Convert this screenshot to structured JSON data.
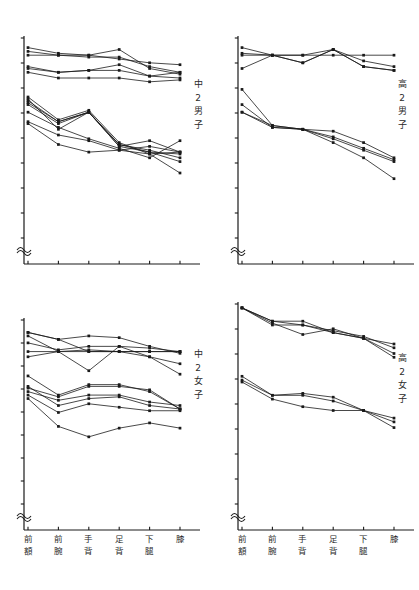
{
  "figure": {
    "title": "",
    "panel_count": 4,
    "x_categories": [
      {
        "id": "forehead",
        "chars": [
          "前",
          "額"
        ]
      },
      {
        "id": "forearm",
        "chars": [
          "前",
          "腕"
        ]
      },
      {
        "id": "hand-dorsum",
        "chars": [
          "手",
          "背"
        ]
      },
      {
        "id": "foot-dorsum",
        "chars": [
          "足",
          "背"
        ]
      },
      {
        "id": "lower-leg",
        "chars": [
          "下",
          "腿"
        ]
      },
      {
        "id": "knee",
        "chars": [
          "膝",
          ""
        ]
      }
    ],
    "axis_break_symbol": "≈",
    "colors": {
      "ink": "#1a1a1a",
      "axis": "#1a1a1a",
      "background": "#ffffff"
    }
  },
  "chart_data": [
    {
      "panel_id": "junior-high-2-boys",
      "type": "line",
      "title": "",
      "group_label_chars": [
        "中",
        "2",
        "男",
        "子"
      ],
      "xlabel": "",
      "ylabel": "",
      "categories": [
        "前額",
        "前腕",
        "手背",
        "足背",
        "下腿",
        "膝"
      ],
      "xlim": [
        0,
        5
      ],
      "ylim": [
        0,
        100
      ],
      "grid": false,
      "legend": "none",
      "y_axis_break": true,
      "y_tick_count": 9,
      "series": [
        {
          "name": "upper-a",
          "cluster": "upper",
          "values": [
            96,
            93,
            92,
            95,
            85,
            82
          ]
        },
        {
          "name": "upper-b",
          "cluster": "upper",
          "values": [
            94,
            92,
            91,
            91,
            86,
            83
          ]
        },
        {
          "name": "upper-c",
          "cluster": "upper",
          "values": [
            92,
            92,
            92,
            90,
            88,
            87
          ]
        },
        {
          "name": "upper-d",
          "cluster": "upper",
          "values": [
            86,
            83,
            84,
            87,
            81,
            80
          ]
        },
        {
          "name": "upper-e",
          "cluster": "upper",
          "values": [
            85,
            83,
            84,
            84,
            81,
            83
          ]
        },
        {
          "name": "upper-f",
          "cluster": "upper",
          "values": [
            83,
            80,
            80,
            80,
            78,
            79
          ]
        },
        {
          "name": "lower-a",
          "cluster": "lower",
          "values": [
            70,
            58,
            63,
            46,
            40,
            30
          ]
        },
        {
          "name": "lower-b",
          "cluster": "lower",
          "values": [
            68,
            57,
            62,
            45,
            41,
            36
          ]
        },
        {
          "name": "lower-c",
          "cluster": "lower",
          "values": [
            67,
            57,
            62,
            45,
            42,
            38
          ]
        },
        {
          "name": "lower-d",
          "cluster": "lower",
          "values": [
            66,
            56,
            62,
            44,
            41,
            40
          ]
        },
        {
          "name": "lower-e",
          "cluster": "lower",
          "values": [
            69,
            53,
            62,
            44,
            47,
            41
          ]
        },
        {
          "name": "lower-f",
          "cluster": "lower",
          "values": [
            57,
            50,
            47,
            42,
            40,
            41
          ]
        },
        {
          "name": "lower-g",
          "cluster": "lower",
          "values": [
            56,
            45,
            41,
            42,
            44,
            41
          ]
        },
        {
          "name": "lower-h",
          "cluster": "lower",
          "values": [
            62,
            54,
            48,
            43,
            38,
            47
          ]
        }
      ]
    },
    {
      "panel_id": "high-school-2-boys",
      "type": "line",
      "title": "",
      "group_label_chars": [
        "高",
        "2",
        "男",
        "子"
      ],
      "xlabel": "",
      "ylabel": "",
      "categories": [
        "前額",
        "前腕",
        "手背",
        "足背",
        "下腿",
        "膝"
      ],
      "xlim": [
        0,
        5
      ],
      "ylim": [
        0,
        100
      ],
      "grid": false,
      "legend": "none",
      "y_axis_break": true,
      "y_tick_count": 9,
      "series": [
        {
          "name": "upper-a",
          "cluster": "upper",
          "values": [
            96,
            92,
            92,
            95,
            89,
            86
          ]
        },
        {
          "name": "upper-b",
          "cluster": "upper",
          "values": [
            92,
            92,
            92,
            92,
            92,
            92
          ]
        },
        {
          "name": "upper-c",
          "cluster": "upper",
          "values": [
            93,
            92,
            88,
            95,
            86,
            84
          ]
        },
        {
          "name": "upper-d",
          "cluster": "upper",
          "values": [
            85,
            92,
            88,
            95,
            86,
            84
          ]
        },
        {
          "name": "lower-a",
          "cluster": "lower",
          "values": [
            74,
            55,
            53,
            46,
            38,
            27
          ]
        },
        {
          "name": "lower-b",
          "cluster": "lower",
          "values": [
            66,
            54,
            53,
            52,
            46,
            38
          ]
        },
        {
          "name": "lower-c",
          "cluster": "lower",
          "values": [
            62,
            54,
            53,
            48,
            42,
            36
          ]
        },
        {
          "name": "lower-d",
          "cluster": "lower",
          "values": [
            62,
            55,
            53,
            49,
            43,
            37
          ]
        }
      ]
    },
    {
      "panel_id": "junior-high-2-girls",
      "type": "line",
      "title": "",
      "group_label_chars": [
        "中",
        "2",
        "女",
        "子"
      ],
      "xlabel": "",
      "ylabel": "",
      "categories": [
        "前額",
        "前腕",
        "手背",
        "足背",
        "下腿",
        "膝"
      ],
      "xlim": [
        0,
        5
      ],
      "ylim": [
        0,
        100
      ],
      "grid": false,
      "legend": "none",
      "y_axis_break": true,
      "y_tick_count": 9,
      "series": [
        {
          "name": "upper-a",
          "cluster": "upper",
          "values": [
            94,
            90,
            92,
            91,
            86,
            82
          ]
        },
        {
          "name": "upper-b",
          "cluster": "upper",
          "values": [
            94,
            90,
            83,
            83,
            83,
            83
          ]
        },
        {
          "name": "upper-c",
          "cluster": "upper",
          "values": [
            88,
            84,
            86,
            86,
            85,
            83
          ]
        },
        {
          "name": "upper-d",
          "cluster": "upper",
          "values": [
            83,
            83,
            83,
            83,
            83,
            83
          ]
        },
        {
          "name": "upper-e",
          "cluster": "upper",
          "values": [
            92,
            83,
            72,
            86,
            80,
            70
          ]
        },
        {
          "name": "upper-f",
          "cluster": "upper",
          "values": [
            80,
            83,
            84,
            83,
            80,
            76
          ]
        },
        {
          "name": "lower-a",
          "cluster": "lower",
          "values": [
            69,
            58,
            64,
            64,
            60,
            50
          ]
        },
        {
          "name": "lower-b",
          "cluster": "lower",
          "values": [
            62,
            57,
            63,
            63,
            61,
            50
          ]
        },
        {
          "name": "lower-c",
          "cluster": "lower",
          "values": [
            60,
            55,
            58,
            58,
            54,
            52
          ]
        },
        {
          "name": "lower-d",
          "cluster": "lower",
          "values": [
            63,
            52,
            56,
            57,
            52,
            50
          ]
        },
        {
          "name": "lower-e",
          "cluster": "lower",
          "values": [
            58,
            48,
            53,
            51,
            49,
            49
          ]
        },
        {
          "name": "lower-f",
          "cluster": "lower",
          "values": [
            56,
            40,
            34,
            39,
            42,
            39
          ]
        }
      ]
    },
    {
      "panel_id": "high-school-2-girls",
      "type": "line",
      "title": "",
      "group_label_chars": [
        "高",
        "2",
        "女",
        "子"
      ],
      "xlabel": "",
      "ylabel": "",
      "categories": [
        "前額",
        "前腕",
        "手背",
        "足背",
        "下腿",
        "膝"
      ],
      "xlim": [
        0,
        5
      ],
      "ylim": [
        0,
        100
      ],
      "grid": false,
      "legend": "none",
      "y_axis_break": true,
      "y_tick_count": 9,
      "series": [
        {
          "name": "upper-a",
          "cluster": "upper",
          "values": [
            99,
            92,
            90,
            87,
            84,
            78
          ]
        },
        {
          "name": "upper-b",
          "cluster": "upper",
          "values": [
            99,
            92,
            92,
            86,
            83,
            75
          ]
        },
        {
          "name": "upper-c",
          "cluster": "upper",
          "values": [
            99,
            91,
            85,
            88,
            83,
            80
          ]
        },
        {
          "name": "upper-d",
          "cluster": "upper",
          "values": [
            99,
            90,
            90,
            86,
            83,
            73
          ]
        },
        {
          "name": "lower-a",
          "cluster": "lower",
          "values": [
            63,
            53,
            54,
            52,
            45,
            36
          ]
        },
        {
          "name": "lower-b",
          "cluster": "lower",
          "values": [
            61,
            53,
            53,
            50,
            45,
            39
          ]
        },
        {
          "name": "lower-c",
          "cluster": "lower",
          "values": [
            60,
            51,
            47,
            45,
            45,
            41
          ]
        }
      ]
    }
  ]
}
